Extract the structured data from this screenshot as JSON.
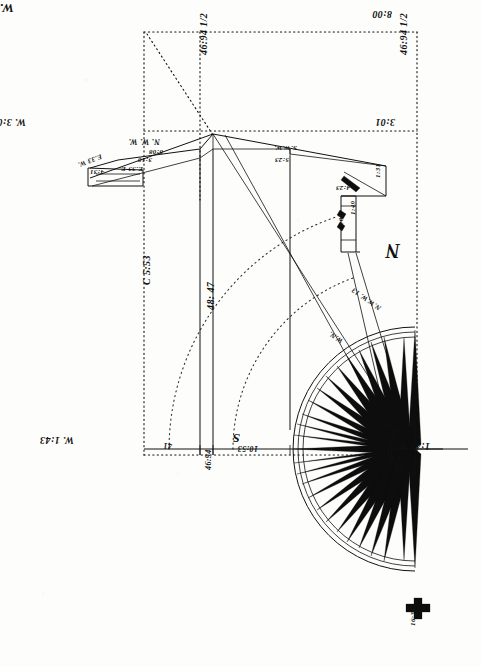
{
  "document": {
    "title": "Manuscript survey plat with half compass rose",
    "orientation_note": "180-degree rotated handwriting",
    "ink_color": "#111111",
    "paper_color": "#fdfdfb"
  },
  "chart_data": {
    "type": "diagram",
    "subtype": "surveying traverse and compass card",
    "annotations": [
      {
        "id": "a1",
        "text": "W. 8:00",
        "x": 14,
        "y": 16,
        "rot": 180,
        "size": "lg",
        "role": "bearing-distance"
      },
      {
        "id": "a2",
        "text": "8:00",
        "x": 392,
        "y": 20,
        "rot": 180,
        "size": "md",
        "role": "bearing-distance"
      },
      {
        "id": "a3",
        "text": "46:94 1/2",
        "x": 198,
        "y": 55,
        "rot": 270,
        "size": "md",
        "role": "dimension"
      },
      {
        "id": "a4",
        "text": "46:94 1/2",
        "x": 398,
        "y": 55,
        "rot": 270,
        "size": "md",
        "role": "dimension"
      },
      {
        "id": "a5",
        "text": "W. 3:01",
        "x": 26,
        "y": 128,
        "rot": 180,
        "size": "md",
        "role": "bearing-distance"
      },
      {
        "id": "a6",
        "text": "3:01",
        "x": 395,
        "y": 128,
        "rot": 180,
        "size": "md",
        "role": "bearing-distance"
      },
      {
        "id": "a7",
        "text": "N. W. W.",
        "x": 160,
        "y": 146,
        "rot": 180,
        "size": "sm",
        "role": "bearing"
      },
      {
        "id": "a8",
        "text": "8:08",
        "x": 163,
        "y": 156,
        "rot": 180,
        "size": "tiny",
        "role": "distance"
      },
      {
        "id": "a9",
        "text": "3:10",
        "x": 152,
        "y": 164,
        "rot": 180,
        "size": "tiny",
        "role": "distance"
      },
      {
        "id": "a10",
        "text": "E.33 E.",
        "x": 143,
        "y": 173,
        "rot": 180,
        "size": "tiny",
        "role": "bearing"
      },
      {
        "id": "a11",
        "text": "E.33 W.",
        "x": 103,
        "y": 160,
        "rot": 160,
        "size": "tiny",
        "role": "bearing"
      },
      {
        "id": "a12",
        "text": "4:31",
        "x": 104,
        "y": 176,
        "rot": 180,
        "size": "tiny",
        "role": "distance"
      },
      {
        "id": "a13",
        "text": "S.W.W.",
        "x": 297,
        "y": 152,
        "rot": 180,
        "size": "tiny",
        "role": "bearing"
      },
      {
        "id": "a14",
        "text": "5:23",
        "x": 289,
        "y": 164,
        "rot": 180,
        "size": "tiny",
        "role": "distance"
      },
      {
        "id": "a15",
        "text": "1:31",
        "x": 374,
        "y": 178,
        "rot": 270,
        "size": "tiny",
        "role": "distance"
      },
      {
        "id": "a16",
        "text": "4:23",
        "x": 350,
        "y": 192,
        "rot": 180,
        "size": "tiny",
        "role": "distance"
      },
      {
        "id": "a17",
        "text": "1:49",
        "x": 349,
        "y": 215,
        "rot": 270,
        "size": "tiny",
        "role": "distance"
      },
      {
        "id": "a18",
        "text": "4:08",
        "x": 337,
        "y": 228,
        "rot": 270,
        "size": "tiny",
        "role": "distance"
      },
      {
        "id": "a19",
        "text": "C 5:53",
        "x": 141,
        "y": 285,
        "rot": 270,
        "size": "md",
        "role": "station-label"
      },
      {
        "id": "a20",
        "text": "48: 47",
        "x": 205,
        "y": 310,
        "rot": 270,
        "size": "md",
        "role": "dimension"
      },
      {
        "id": "a21",
        "text": "N",
        "x": 400,
        "y": 262,
        "rot": 180,
        "size": "xl",
        "role": "cardinal-north"
      },
      {
        "id": "a22",
        "text": "N.W.W. 13",
        "x": 378,
        "y": 312,
        "rot": 215,
        "size": "tiny",
        "role": "rose-bearing"
      },
      {
        "id": "a23",
        "text": "W.N.",
        "x": 340,
        "y": 345,
        "rot": 215,
        "size": "tiny",
        "role": "rose-bearing"
      },
      {
        "id": "a24",
        "text": "1:43",
        "x": 395,
        "y": 433,
        "rot": 200,
        "size": "tiny",
        "role": "rose-bearing"
      },
      {
        "id": "a25",
        "text": "1:43 W.",
        "x": 430,
        "y": 452,
        "rot": 180,
        "size": "md",
        "role": "bearing-distance"
      },
      {
        "id": "a26",
        "text": "S",
        "x": 240,
        "y": 446,
        "rot": 180,
        "size": "lg",
        "role": "cardinal-south"
      },
      {
        "id": "a27",
        "text": "10:53",
        "x": 258,
        "y": 453,
        "rot": 180,
        "size": "sm",
        "role": "distance"
      },
      {
        "id": "a28",
        "text": "W. 1:43",
        "x": 74,
        "y": 446,
        "rot": 180,
        "size": "md",
        "role": "bearing-distance"
      },
      {
        "id": "a29",
        "text": "41",
        "x": 172,
        "y": 450,
        "rot": 180,
        "size": "sm",
        "role": "distance"
      },
      {
        "id": "a30",
        "text": "46:94",
        "x": 204,
        "y": 470,
        "rot": 270,
        "size": "sm",
        "role": "dimension"
      },
      {
        "id": "a31",
        "text": "16:31",
        "x": 409,
        "y": 626,
        "rot": 270,
        "size": "tiny",
        "role": "distance"
      }
    ],
    "compass": {
      "center": [
        415,
        449
      ],
      "outer_radius": 122,
      "inner_hub_radius": 27,
      "half": "west",
      "spike_count": 21,
      "cardinals": [
        "N",
        "S"
      ]
    },
    "frame": {
      "type": "dotted rectangle with diagonal",
      "corners": [
        [
          144,
          32
        ],
        [
          416,
          32
        ],
        [
          416,
          455
        ],
        [
          144,
          455
        ]
      ]
    },
    "arcs": [
      {
        "center": [
          415,
          449
        ],
        "radius": 246,
        "style": "dotted"
      },
      {
        "center": [
          415,
          449
        ],
        "radius": 182,
        "style": "dotted"
      }
    ]
  }
}
